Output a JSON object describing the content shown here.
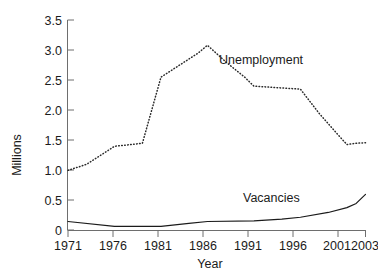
{
  "chart_data": {
    "type": "line",
    "title": "",
    "xlabel": "Year",
    "ylabel": "Millions",
    "xlim": [
      1971,
      2003
    ],
    "ylim": [
      0,
      3.5
    ],
    "grid": false,
    "legend_position": "inline-annotation",
    "x_tick_labels": [
      "1971",
      "1976",
      "1981",
      "1986",
      "1991",
      "1996",
      "2001",
      "2003"
    ],
    "x_ticks": [
      1971,
      1976,
      1981,
      1986,
      1991,
      1996,
      2001,
      2003
    ],
    "y_tick_labels": [
      "0",
      "0.5",
      "1.0",
      "1.5",
      "2.0",
      "2.5",
      "3.0",
      "3.5"
    ],
    "y_ticks": [
      0,
      0.5,
      1.0,
      1.5,
      2.0,
      2.5,
      3.0,
      3.5
    ],
    "series": [
      {
        "name": "Unemployment",
        "style": "dotted",
        "color": "#2a2a2a",
        "x": [
          1971,
          1973,
          1976,
          1979,
          1981,
          1983,
          1985,
          1986,
          1988,
          1990,
          1991,
          1993,
          1996,
          1998,
          2000,
          2001,
          2002,
          2003
        ],
        "values": [
          1.0,
          1.1,
          1.4,
          1.45,
          2.55,
          2.75,
          2.95,
          3.08,
          2.8,
          2.55,
          2.4,
          2.38,
          2.35,
          1.95,
          1.6,
          1.43,
          1.45,
          1.46
        ]
      },
      {
        "name": "Vacancies",
        "style": "solid",
        "color": "#1b1b1b",
        "x": [
          1971,
          1976,
          1981,
          1984,
          1986,
          1991,
          1994,
          1996,
          1999,
          2001,
          2002,
          2003
        ],
        "values": [
          0.15,
          0.07,
          0.07,
          0.12,
          0.15,
          0.16,
          0.19,
          0.22,
          0.3,
          0.38,
          0.45,
          0.6
        ]
      }
    ],
    "annotations": [
      {
        "text": "Unemployment",
        "x": 1989.5,
        "y": 2.72
      },
      {
        "text": "Vacancies",
        "x": 1995.2,
        "y": 0.62
      }
    ]
  }
}
